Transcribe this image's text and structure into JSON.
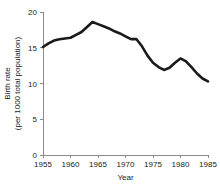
{
  "chart_data": {
    "type": "line",
    "title": "",
    "xlabel": "Year",
    "ylabel": "Birth rate (per 1000 total population)",
    "ylabel_line1": "Birth rate",
    "ylabel_line2": "(per 1000 total population)",
    "xlim": [
      1955,
      1985
    ],
    "ylim": [
      0,
      20
    ],
    "xticks": [
      1955,
      1960,
      1965,
      1970,
      1975,
      1980,
      1985
    ],
    "yticks": [
      0,
      5,
      10,
      15,
      20
    ],
    "grid": false,
    "legend": false,
    "line_color": "#1a1a1a",
    "axis_color": "#8a8a8a",
    "series": [
      {
        "name": "Birth rate",
        "x": [
          1955,
          1956,
          1957,
          1958,
          1959,
          1960,
          1961,
          1962,
          1963,
          1964,
          1965,
          1966,
          1967,
          1968,
          1969,
          1970,
          1971,
          1972,
          1973,
          1974,
          1975,
          1976,
          1977,
          1978,
          1979,
          1980,
          1981,
          1982,
          1983,
          1984,
          1985
        ],
        "values": [
          15.1,
          15.6,
          16.0,
          16.2,
          16.3,
          16.4,
          16.8,
          17.2,
          17.9,
          18.6,
          18.3,
          18.0,
          17.7,
          17.3,
          17.0,
          16.6,
          16.2,
          16.2,
          15.2,
          13.9,
          12.9,
          12.3,
          11.9,
          12.2,
          12.9,
          13.5,
          13.1,
          12.3,
          11.4,
          10.7,
          10.3
        ]
      }
    ]
  }
}
